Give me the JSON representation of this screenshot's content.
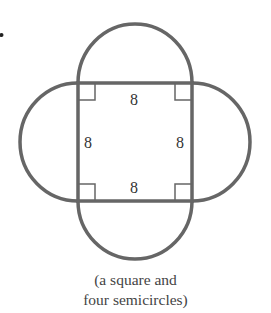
{
  "figure": {
    "shape": "square with four semicircles on each side",
    "side_labels": {
      "top": "8",
      "left": "8",
      "right": "8",
      "bottom": "8"
    },
    "right_angle_markers": 4,
    "stroke_color": "#666666",
    "caption_line1": "(a square and",
    "caption_line2": "four semicircles)",
    "fragment_mark": "."
  }
}
